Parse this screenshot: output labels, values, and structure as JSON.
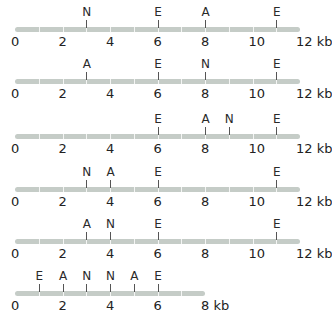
{
  "diagram": {
    "type": "restriction-maps",
    "unit": "kb",
    "enzyme_legend": [
      "E",
      "A",
      "N"
    ],
    "maps": [
      {
        "length": 12,
        "axis_ticks": [
          "0",
          "2",
          "4",
          "6",
          "8",
          "10",
          "12 kb"
        ],
        "sites": [
          {
            "enzyme": "N",
            "pos": 3
          },
          {
            "enzyme": "E",
            "pos": 6
          },
          {
            "enzyme": "A",
            "pos": 8
          },
          {
            "enzyme": "E",
            "pos": 11
          }
        ]
      },
      {
        "length": 12,
        "axis_ticks": [
          "0",
          "2",
          "4",
          "6",
          "8",
          "10",
          "12 kb"
        ],
        "sites": [
          {
            "enzyme": "A",
            "pos": 3
          },
          {
            "enzyme": "E",
            "pos": 6
          },
          {
            "enzyme": "N",
            "pos": 8
          },
          {
            "enzyme": "E",
            "pos": 11
          }
        ]
      },
      {
        "length": 12,
        "axis_ticks": [
          "0",
          "2",
          "4",
          "6",
          "8",
          "10",
          "12 kb"
        ],
        "sites": [
          {
            "enzyme": "E",
            "pos": 6
          },
          {
            "enzyme": "A",
            "pos": 8
          },
          {
            "enzyme": "N",
            "pos": 9
          },
          {
            "enzyme": "E",
            "pos": 11
          }
        ]
      },
      {
        "length": 12,
        "axis_ticks": [
          "0",
          "2",
          "4",
          "6",
          "8",
          "10",
          "12 kb"
        ],
        "sites": [
          {
            "enzyme": "N",
            "pos": 3
          },
          {
            "enzyme": "A",
            "pos": 4
          },
          {
            "enzyme": "E",
            "pos": 6
          },
          {
            "enzyme": "E",
            "pos": 11
          }
        ]
      },
      {
        "length": 12,
        "axis_ticks": [
          "0",
          "2",
          "4",
          "6",
          "8",
          "10",
          "12 kb"
        ],
        "sites": [
          {
            "enzyme": "A",
            "pos": 3
          },
          {
            "enzyme": "N",
            "pos": 4
          },
          {
            "enzyme": "E",
            "pos": 6
          },
          {
            "enzyme": "E",
            "pos": 11
          }
        ]
      },
      {
        "length": 8,
        "axis_ticks": [
          "0",
          "2",
          "4",
          "6",
          "8 kb"
        ],
        "sites": [
          {
            "enzyme": "E",
            "pos": 1
          },
          {
            "enzyme": "A",
            "pos": 2
          },
          {
            "enzyme": "N",
            "pos": 3
          },
          {
            "enzyme": "N",
            "pos": 4
          },
          {
            "enzyme": "A",
            "pos": 5
          },
          {
            "enzyme": "E",
            "pos": 6
          }
        ]
      }
    ]
  },
  "colors": {
    "bar": "#c5ccc7",
    "text": "#222222",
    "site_line": "#555555"
  }
}
